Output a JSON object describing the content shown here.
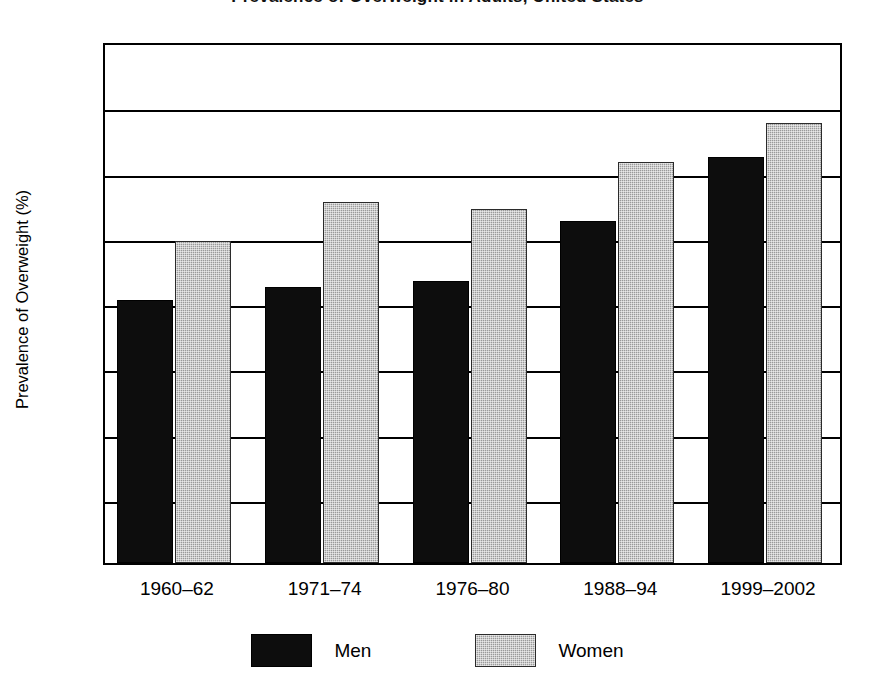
{
  "chart_data": {
    "type": "bar",
    "title": "Prevalence of Overweight in Adults, United States",
    "xlabel": "",
    "ylabel": "Prevalence of Overweight (%)",
    "categories": [
      "1960–62",
      "1971–74",
      "1976–80",
      "1988–94",
      "1999–2002"
    ],
    "series": [
      {
        "name": "Men",
        "color": "#0d0d0d",
        "values": [
          40.3,
          42.3,
          43.2,
          52.4,
          62.3
        ]
      },
      {
        "name": "Women",
        "color": "#9a9a9a",
        "values": [
          49.3,
          55.3,
          54.3,
          61.4,
          67.5
        ]
      }
    ],
    "ylim": [
      0,
      80
    ],
    "yticks": [
      0,
      10,
      20,
      30,
      40,
      50,
      60,
      70,
      80
    ],
    "ytick_labels": [
      "0",
      "10",
      "20",
      "30",
      "40",
      "50",
      "60",
      "70",
      "80"
    ],
    "grid": "horizontal",
    "legend_position": "bottom"
  },
  "legend": {
    "items": [
      {
        "label": "Men",
        "swatch": "black-solid-swatch"
      },
      {
        "label": "Women",
        "swatch": "gray-hatched-swatch"
      }
    ]
  }
}
